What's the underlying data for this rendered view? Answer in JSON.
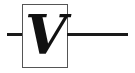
{
  "diagram": {
    "type": "circuit-symbol",
    "component": "voltmeter",
    "symbol_label": "V",
    "colors": {
      "wire": "#1a1a1a",
      "box_border": "#555555",
      "label": "#111111",
      "background": "#ffffff"
    },
    "connections": [
      "left-terminal-wire",
      "right-terminal-wire"
    ]
  }
}
